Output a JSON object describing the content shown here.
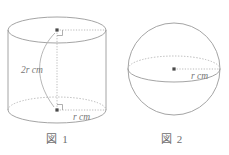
{
  "page": {
    "background_color": "#ffffff",
    "line_color": "#9a9a9a",
    "text_color": "#6e6e6e",
    "width": 229,
    "height": 155
  },
  "figures": [
    {
      "id": "figure-1",
      "caption": "図 1",
      "shape": "cylinder",
      "labels": {
        "height": "2r cm",
        "radius": "r cm"
      },
      "geometry": {
        "top_center_x": 57,
        "top_center_y": 30,
        "bottom_center_x": 57,
        "bottom_center_y": 110,
        "ellipse_rx": 49,
        "ellipse_ry": 13
      }
    },
    {
      "id": "figure-2",
      "caption": "図 2",
      "shape": "sphere",
      "labels": {
        "radius": "r cm"
      },
      "geometry": {
        "center_x": 59,
        "center_y": 69,
        "circle_r": 46,
        "equator_rx": 46,
        "equator_ry": 13
      }
    }
  ]
}
